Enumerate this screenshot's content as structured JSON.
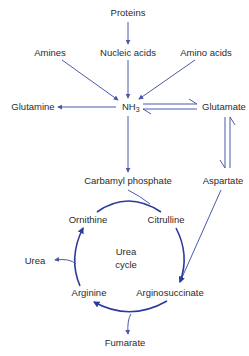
{
  "colors": {
    "arrow": "#4a5aa8",
    "cycle": "#2a3b9a",
    "text": "#2b2b2b",
    "background": "#ffffff"
  },
  "nodes": {
    "proteins": "Proteins",
    "amines": "Amines",
    "nucleic_acids": "Nucleic acids",
    "amino_acids": "Amino acids",
    "glutamine": "Glutamine",
    "nh3": "NH",
    "nh3_sub": "3",
    "glutamate": "Glutamate",
    "carbamyl_phosphate": "Carbamyl phosphate",
    "aspartate": "Aspartate",
    "ornithine": "Ornithine",
    "citrulline": "Citrulline",
    "urea": "Urea",
    "urea_cycle_line1": "Urea",
    "urea_cycle_line2": "cycle",
    "arginine": "Arginine",
    "argininosuccinate": "Arginosuccinate",
    "fumarate": "Fumarate"
  },
  "edges": [
    {
      "from": "Proteins",
      "to": "Nucleic acids"
    },
    {
      "from": "Amines",
      "to": "NH3"
    },
    {
      "from": "Nucleic acids",
      "to": "NH3"
    },
    {
      "from": "Amino acids",
      "to": "NH3"
    },
    {
      "from": "NH3",
      "to": "Glutamine"
    },
    {
      "from": "NH3",
      "to": "Glutamate",
      "reversible": true
    },
    {
      "from": "Glutamate",
      "to": "Aspartate",
      "reversible": true
    },
    {
      "from": "NH3",
      "to": "Carbamyl phosphate"
    },
    {
      "from": "Carbamyl phosphate",
      "to": "Citrulline"
    },
    {
      "from": "Ornithine",
      "to": "Citrulline"
    },
    {
      "from": "Citrulline",
      "to": "Arginosuccinate"
    },
    {
      "from": "Aspartate",
      "to": "Arginosuccinate"
    },
    {
      "from": "Arginosuccinate",
      "to": "Arginine"
    },
    {
      "from": "Arginosuccinate",
      "to": "Fumarate"
    },
    {
      "from": "Arginine",
      "to": "Ornithine"
    },
    {
      "from": "Arginine",
      "to": "Urea"
    }
  ]
}
